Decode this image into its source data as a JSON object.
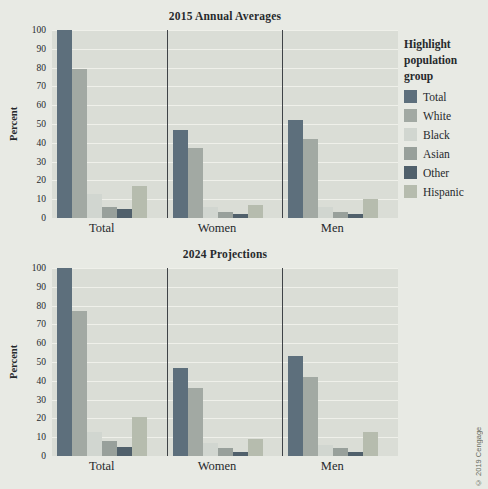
{
  "figure": {
    "copyright": "© 2019 Cengage"
  },
  "legend": {
    "title": "Highlight population group",
    "items": [
      {
        "label": "Total",
        "color": "#5d6f7c"
      },
      {
        "label": "White",
        "color": "#a2a9a3"
      },
      {
        "label": "Black",
        "color": "#d1d6d0"
      },
      {
        "label": "Asian",
        "color": "#98a09b"
      },
      {
        "label": "Other",
        "color": "#50606b"
      },
      {
        "label": "Hispanic",
        "color": "#b6bcae"
      }
    ]
  },
  "chart_data": [
    {
      "type": "bar",
      "title": "2015 Annual Averages",
      "ylabel": "Percent",
      "ylim": [
        0,
        100
      ],
      "ytick_step": 10,
      "grid": true,
      "legend_position": "right",
      "categories": [
        "Total",
        "Women",
        "Men"
      ],
      "series": [
        {
          "name": "Total",
          "values": [
            100,
            47,
            52
          ]
        },
        {
          "name": "White",
          "values": [
            79,
            37,
            42
          ]
        },
        {
          "name": "Black",
          "values": [
            13,
            6,
            6
          ]
        },
        {
          "name": "Asian",
          "values": [
            6,
            3,
            3
          ]
        },
        {
          "name": "Other",
          "values": [
            5,
            2,
            2
          ]
        },
        {
          "name": "Hispanic",
          "values": [
            17,
            7,
            10
          ]
        }
      ]
    },
    {
      "type": "bar",
      "title": "2024 Projections",
      "ylabel": "Percent",
      "ylim": [
        0,
        100
      ],
      "ytick_step": 10,
      "grid": true,
      "legend_position": "right",
      "categories": [
        "Total",
        "Women",
        "Men"
      ],
      "series": [
        {
          "name": "Total",
          "values": [
            100,
            47,
            53
          ]
        },
        {
          "name": "White",
          "values": [
            77,
            36,
            42
          ]
        },
        {
          "name": "Black",
          "values": [
            13,
            7,
            6
          ]
        },
        {
          "name": "Asian",
          "values": [
            8,
            4,
            4
          ]
        },
        {
          "name": "Other",
          "values": [
            5,
            2,
            2
          ]
        },
        {
          "name": "Hispanic",
          "values": [
            21,
            9,
            13
          ]
        }
      ]
    }
  ]
}
